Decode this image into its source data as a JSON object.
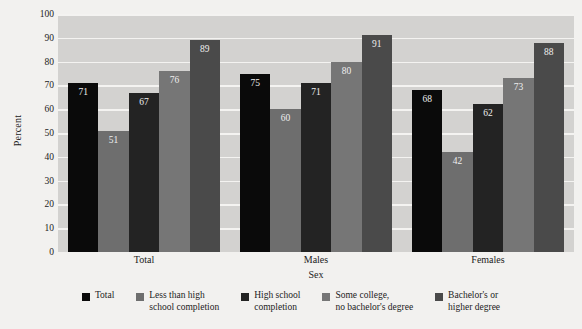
{
  "chart_data": {
    "type": "bar",
    "title": "",
    "xlabel": "Sex",
    "ylabel": "Percent",
    "ylim": [
      0,
      100
    ],
    "ytick_labels": [
      "100",
      "90",
      "80",
      "70",
      "60",
      "50",
      "40",
      "30",
      "20",
      "10",
      "0"
    ],
    "ytick_values": [
      100,
      90,
      80,
      70,
      60,
      50,
      40,
      30,
      20,
      10,
      0
    ],
    "grid": true,
    "legend_position": "bottom",
    "categories": [
      "Total",
      "Males",
      "Females"
    ],
    "series": [
      {
        "name": "Total",
        "color": "#0a0a0a",
        "values": [
          71,
          75,
          68
        ]
      },
      {
        "name": "Less than high\nschool completion",
        "color": "#6e6e6e",
        "values": [
          51,
          60,
          42
        ]
      },
      {
        "name": "High school\ncompletion",
        "color": "#232323",
        "values": [
          67,
          71,
          62
        ]
      },
      {
        "name": "Some college,\nno bachelor's degree",
        "color": "#767676",
        "values": [
          76,
          80,
          73
        ]
      },
      {
        "name": "Bachelor's or\nhigher degree",
        "color": "#4a4a4a",
        "values": [
          89,
          91,
          88
        ]
      }
    ],
    "plot_background": "#d3d2d0",
    "gridline_color": "#f4f3f1",
    "page_background": "#f2f1ef"
  }
}
